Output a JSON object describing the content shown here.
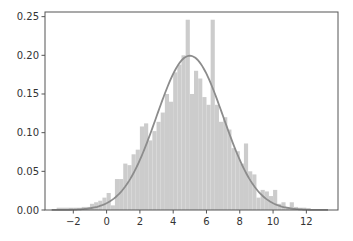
{
  "chart_data": {
    "type": "bar",
    "subtype": "histogram_with_density_curve",
    "title": "",
    "xlabel": "",
    "ylabel": "",
    "xlim": [
      -3.7,
      13.9
    ],
    "ylim": [
      0.0,
      0.256
    ],
    "x_ticks": [
      -2,
      0,
      2,
      4,
      6,
      8,
      10,
      12
    ],
    "x_tick_labels": [
      "−2",
      "0",
      "2",
      "4",
      "6",
      "8",
      "10",
      "12"
    ],
    "y_ticks": [
      0.0,
      0.05,
      0.1,
      0.15,
      0.2,
      0.25
    ],
    "y_tick_labels": [
      "0.00",
      "0.05",
      "0.10",
      "0.15",
      "0.20",
      "0.25"
    ],
    "grid": false,
    "legend": null,
    "bin_width": 0.25,
    "bins_start": [
      -3.0,
      -2.5,
      -2.0,
      -1.5,
      -1.0,
      -0.75,
      -0.5,
      -0.25,
      0.0,
      0.25,
      0.5,
      0.75,
      1.0,
      1.25,
      1.5,
      1.75,
      2.0,
      2.25,
      2.5,
      2.75,
      3.0,
      3.25,
      3.5,
      3.75,
      4.0,
      4.25,
      4.5,
      4.75,
      5.0,
      5.25,
      5.5,
      5.75,
      6.0,
      6.25,
      6.5,
      6.75,
      7.0,
      7.25,
      7.5,
      7.75,
      8.0,
      8.25,
      8.5,
      8.75,
      9.0,
      9.25,
      9.5,
      9.75,
      10.0,
      10.25,
      10.5,
      10.75,
      11.0,
      11.25,
      11.5,
      12.0
    ],
    "density": [
      0.003,
      0.003,
      0.003,
      0.004,
      0.008,
      0.01,
      0.012,
      0.016,
      0.022,
      0.006,
      0.04,
      0.04,
      0.06,
      0.058,
      0.072,
      0.078,
      0.108,
      0.112,
      0.09,
      0.102,
      0.114,
      0.126,
      0.15,
      0.14,
      0.178,
      0.188,
      0.2,
      0.246,
      0.15,
      0.18,
      0.17,
      0.146,
      0.136,
      0.246,
      0.136,
      0.114,
      0.12,
      0.104,
      0.08,
      0.076,
      0.06,
      0.086,
      0.05,
      0.046,
      0.016,
      0.026,
      0.024,
      0.018,
      0.026,
      0.008,
      0.01,
      0.004,
      0.01,
      0.004,
      0.003,
      0.002
    ],
    "curve": {
      "type": "normal_pdf",
      "mean": 5.0,
      "std": 2.0,
      "x_range": [
        -3.3,
        13.3
      ],
      "peak": 0.2
    },
    "colors": {
      "bars": "#cccccc",
      "curve": "#8c8c8c",
      "axes": "#555555",
      "background": "#ffffff"
    }
  }
}
